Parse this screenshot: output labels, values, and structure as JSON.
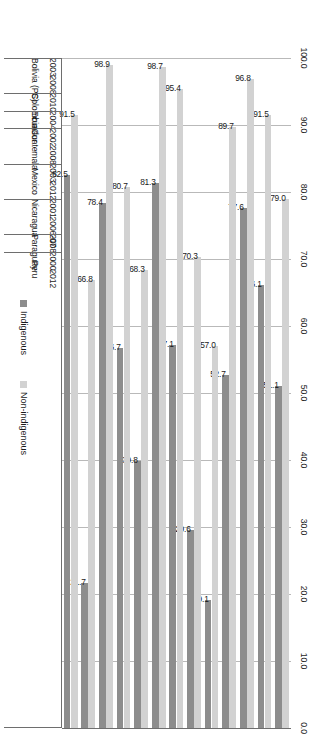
{
  "chart_data": {
    "type": "bar",
    "orientation": "horizontal",
    "title": "",
    "xlabel": "",
    "ylabel": "",
    "ylim": [
      0,
      100
    ],
    "axis_ticks": [
      "100.0",
      "90.0",
      "80.0",
      "70.0",
      "60.0",
      "50.0",
      "40.0",
      "30.0",
      "20.0",
      "10.0",
      "0.0"
    ],
    "axis_tick_values": [
      100,
      90,
      80,
      70,
      60,
      50,
      40,
      30,
      20,
      10,
      0
    ],
    "axis_direction": "descending-left-to-right",
    "grid": true,
    "legend_position": "bottom-right",
    "legend": [
      "Indigenous",
      "Non-indigenous"
    ],
    "series": [
      {
        "name": "Indigenous",
        "color": "#8d8d8d"
      },
      {
        "name": "Non-indigenous",
        "color": "#d2d2d2"
      }
    ],
    "groups": [
      {
        "country": "Bolivia (PS)",
        "entries": [
          {
            "year": "2003",
            "indigenous": 51.1,
            "non_indigenous": 79.0,
            "indigenous_label": "51.1",
            "non_indigenous_label": "79.0"
          },
          {
            "year": "2008",
            "indigenous": 66.1,
            "non_indigenous": 91.5,
            "indigenous_label": "66.1",
            "non_indigenous_label": "91.5"
          }
        ]
      },
      {
        "country": "Colombia",
        "entries": [
          {
            "year": "2010",
            "indigenous": 77.6,
            "non_indigenous": 96.8,
            "indigenous_label": "77.6",
            "non_indigenous_label": "96.8"
          }
        ]
      },
      {
        "country": "Ecuador",
        "entries": [
          {
            "year": "2004",
            "indigenous": 52.7,
            "non_indigenous": 89.7,
            "indigenous_label": "52.7",
            "non_indigenous_label": "89.7"
          }
        ]
      },
      {
        "country": "Guatemala",
        "entries": [
          {
            "year": "2002",
            "indigenous": 19.1,
            "non_indigenous": 57.0,
            "indigenous_label": "19.1",
            "non_indigenous_label": "57.0"
          },
          {
            "year": "2008",
            "indigenous": 29.6,
            "non_indigenous": 70.3,
            "indigenous_label": "29.6",
            "non_indigenous_label": "70.3"
          }
        ]
      },
      {
        "country": "Mexico",
        "entries": [
          {
            "year": "2003",
            "indigenous": 57.1,
            "non_indigenous": 95.4,
            "indigenous_label": "57.1",
            "non_indigenous_label": "95.4"
          },
          {
            "year": "2012",
            "indigenous": 81.3,
            "non_indigenous": 98.7,
            "indigenous_label": "81.3",
            "non_indigenous_label": "98.7"
          }
        ]
      },
      {
        "country": "Nicaragua",
        "entries": [
          {
            "year": "2001",
            "indigenous": 39.8,
            "non_indigenous": 68.3,
            "indigenous_label": "39.8",
            "non_indigenous_label": "68.3"
          },
          {
            "year": "2006-07",
            "indigenous": 56.7,
            "non_indigenous": 80.7,
            "indigenous_label": "56.7",
            "non_indigenous_label": "80.7"
          }
        ]
      },
      {
        "country": "Paraguay",
        "entries": [
          {
            "year": "2008",
            "indigenous": 78.4,
            "non_indigenous": 98.9,
            "indigenous_label": "78.4",
            "non_indigenous_label": "98.9"
          }
        ]
      },
      {
        "country": "Peru",
        "entries": [
          {
            "year": "2000",
            "indigenous": 21.7,
            "non_indigenous": 66.8,
            "indigenous_label": "21.7",
            "non_indigenous_label": "66.8"
          },
          {
            "year": "2012",
            "indigenous": 82.5,
            "non_indigenous": 91.5,
            "indigenous_label": "82.5",
            "non_indigenous_label": "91.5"
          }
        ]
      }
    ]
  },
  "colors": {
    "indigenous": "#8d8d8d",
    "non_indigenous": "#d2d2d2",
    "axis": "#6e6e6e",
    "grid": "#b9b9b9",
    "text": "#1a1a1a",
    "background": "#ffffff"
  }
}
